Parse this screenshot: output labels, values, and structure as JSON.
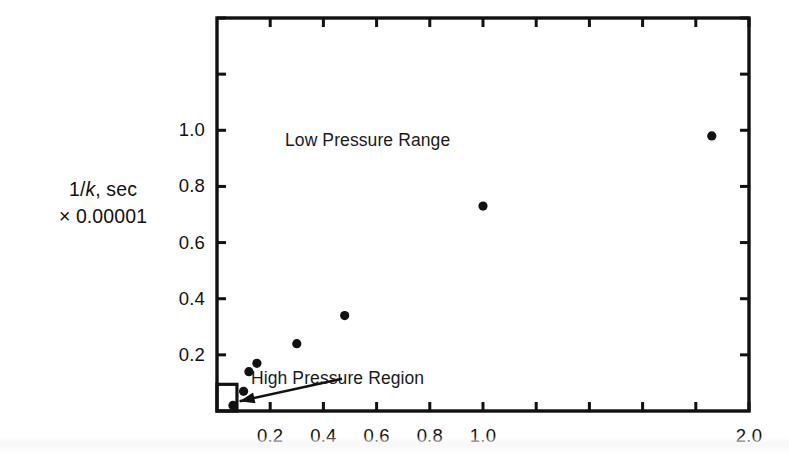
{
  "figure": {
    "background": "#ffffff",
    "ink": "#111111"
  },
  "axis_label": {
    "line1_prefix": "1/",
    "line1_symbol": "k",
    "line1_suffix": ", sec",
    "line2": "× 0.00001"
  },
  "annotations": [
    {
      "name": "low-pressure-range",
      "text": "Low Pressure Range",
      "x": 285,
      "y": 130
    },
    {
      "name": "high-pressure-region",
      "text": "High Pressure Region",
      "x": 251,
      "y": 368
    }
  ],
  "chart_data": {
    "type": "scatter",
    "title": "",
    "xlabel": "",
    "ylabel": "1/k, sec × 0.00001",
    "xlim": [
      0.0,
      2.0
    ],
    "ylim": [
      0.0,
      1.4
    ],
    "grid": false,
    "legend": "none",
    "x_ticks": [
      0.2,
      0.4,
      0.6,
      0.8,
      1.0,
      1.2,
      1.4,
      1.6,
      1.8,
      2.0
    ],
    "x_tick_labels": [
      "0.2",
      "0.4",
      "0.6",
      "0.8",
      "1.0",
      "",
      "",
      "",
      "",
      "2.0"
    ],
    "y_ticks": [
      0.2,
      0.4,
      0.6,
      0.8,
      1.0,
      1.2,
      1.4
    ],
    "y_tick_labels": [
      "0.2",
      "0.4",
      "0.6",
      "0.8",
      "1.0",
      "",
      ""
    ],
    "ticks_all_sides": true,
    "marker": "filled-circle",
    "marker_color": "#111111",
    "points": [
      {
        "x": 0.06,
        "y": 0.02
      },
      {
        "x": 0.1,
        "y": 0.07
      },
      {
        "x": 0.12,
        "y": 0.14
      },
      {
        "x": 0.15,
        "y": 0.17
      },
      {
        "x": 0.3,
        "y": 0.24
      },
      {
        "x": 0.48,
        "y": 0.34
      },
      {
        "x": 1.0,
        "y": 0.73
      },
      {
        "x": 1.86,
        "y": 0.98
      }
    ],
    "inset_box": {
      "name": "high-pressure-region-box",
      "x0": 0.0,
      "y0": 0.0,
      "x1": 0.075,
      "y1": 0.095
    },
    "arrow": {
      "name": "high-pressure-arrow",
      "from_x": 0.47,
      "from_y": 0.115,
      "to_x": 0.085,
      "to_y": 0.035
    }
  }
}
